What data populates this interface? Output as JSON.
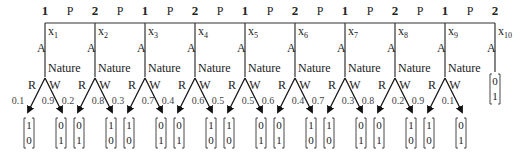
{
  "diagram": {
    "type": "centipede-game-tree",
    "pass_label": "P",
    "accept_label": "A",
    "nature_label": "Nature",
    "branch_left_label": "R",
    "branch_right_label": "W",
    "nodes": [
      {
        "player": "1",
        "name": "x",
        "sub": "1",
        "pL": "0.1",
        "pR": "0.9",
        "payL": [
          "1",
          "0"
        ],
        "payR": [
          "0",
          "1"
        ]
      },
      {
        "player": "2",
        "name": "x",
        "sub": "2",
        "pL": "0.2",
        "pR": "0.8",
        "payL": [
          "0",
          "1"
        ],
        "payR": [
          "1",
          "0"
        ]
      },
      {
        "player": "1",
        "name": "x",
        "sub": "3",
        "pL": "0.3",
        "pR": "0.7",
        "payL": [
          "1",
          "0"
        ],
        "payR": [
          "0",
          "1"
        ]
      },
      {
        "player": "2",
        "name": "x",
        "sub": "4",
        "pL": "0.4",
        "pR": "0.6",
        "payL": [
          "0",
          "1"
        ],
        "payR": [
          "1",
          "0"
        ]
      },
      {
        "player": "1",
        "name": "x",
        "sub": "5",
        "pL": "0.5",
        "pR": "0.5",
        "payL": [
          "1",
          "0"
        ],
        "payR": [
          "0",
          "1"
        ]
      },
      {
        "player": "2",
        "name": "x",
        "sub": "6",
        "pL": "0.6",
        "pR": "0.4",
        "payL": [
          "0",
          "1"
        ],
        "payR": [
          "1",
          "0"
        ]
      },
      {
        "player": "1",
        "name": "x",
        "sub": "7",
        "pL": "0.7",
        "pR": "0.3",
        "payL": [
          "1",
          "0"
        ],
        "payR": [
          "0",
          "1"
        ]
      },
      {
        "player": "2",
        "name": "x",
        "sub": "8",
        "pL": "0.8",
        "pR": "0.2",
        "payL": [
          "0",
          "1"
        ],
        "payR": [
          "1",
          "0"
        ]
      },
      {
        "player": "1",
        "name": "x",
        "sub": "9",
        "pL": "0.9",
        "pR": "0.1",
        "payL": [
          "1",
          "0"
        ],
        "payR": [
          "0",
          "1"
        ]
      },
      {
        "player": "2",
        "name": "x",
        "sub": "10",
        "terminal": [
          "0",
          "1"
        ]
      }
    ]
  }
}
